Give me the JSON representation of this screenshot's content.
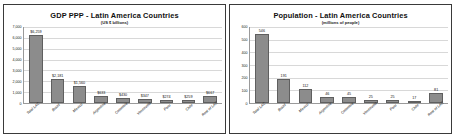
{
  "slide": {
    "background_color": "#ffffff",
    "bar_color": "#8c8c8c"
  },
  "chart_data": [
    {
      "type": "bar",
      "panel_name": "gdp-ppp-chart",
      "title": "GDP PPP - Latin America Countries",
      "subtitle": "(US $ billions)",
      "xlabel": "",
      "ylabel": "",
      "ylim": [
        0,
        7000
      ],
      "grid": true,
      "legend": "none",
      "categories": [
        "Total LAC",
        "Brazil",
        "Mexico",
        "Argentina",
        "Colombia",
        "Venezuela",
        "Peru",
        "Chile",
        "Rest of LAC"
      ],
      "values": [
        6259,
        2181,
        1560,
        633,
        430,
        347,
        274,
        259,
        667
      ],
      "value_labels": [
        "$6,259",
        "$2,181",
        "$1,560",
        "$633",
        "$430",
        "$347",
        "$274",
        "$259",
        "$667"
      ],
      "ytick_labels": [
        "7,000",
        "6,000",
        "5,000",
        "4,000",
        "3,000",
        "2,000",
        "1,000",
        "0"
      ],
      "ytick_values": [
        7000,
        6000,
        5000,
        4000,
        3000,
        2000,
        1000,
        0
      ]
    },
    {
      "type": "bar",
      "panel_name": "population-chart",
      "title": "Population - Latin America Countries",
      "subtitle": "(millions of people)",
      "xlabel": "",
      "ylabel": "",
      "ylim": [
        0,
        600
      ],
      "grid": true,
      "legend": "none",
      "categories": [
        "Total LAC",
        "Brazil",
        "Mexico",
        "Argentina",
        "Colombia",
        "Venezuela",
        "Peru",
        "Chile",
        "Rest of LAC"
      ],
      "values": [
        546,
        191,
        112,
        46,
        45,
        25,
        25,
        17,
        81
      ],
      "value_labels": [
        "546",
        "191",
        "112",
        "46",
        "45",
        "25",
        "25",
        "17",
        "81"
      ],
      "ytick_labels": [
        "600",
        "500",
        "400",
        "300",
        "200",
        "100",
        "0"
      ],
      "ytick_values": [
        600,
        500,
        400,
        300,
        200,
        100,
        0
      ]
    }
  ]
}
